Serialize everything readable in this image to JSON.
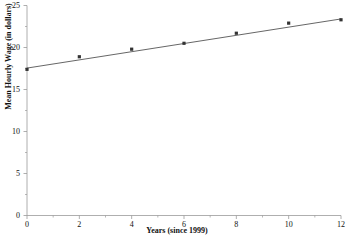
{
  "chart_data": {
    "type": "scatter",
    "title": "",
    "xlabel": "Years (since 1999)",
    "ylabel": "Mean Hourly Wage (in dollars)",
    "x": [
      0,
      2,
      4,
      6,
      8,
      10,
      12
    ],
    "values": [
      17.4,
      18.9,
      19.8,
      20.5,
      21.7,
      22.9,
      23.3
    ],
    "series": [
      {
        "name": "Mean Hourly Wage",
        "values": [
          17.4,
          18.9,
          19.8,
          20.5,
          21.7,
          22.9,
          23.3
        ],
        "marker": "square",
        "marker_color": "#333333"
      },
      {
        "name": "Linear trend line",
        "type": "line",
        "endpoints_x": [
          0,
          12
        ],
        "endpoints_y": [
          17.55,
          23.4
        ],
        "line_color": "#555555"
      }
    ],
    "xlim": [
      0,
      12
    ],
    "ylim": [
      0,
      25
    ],
    "xticks": [
      0,
      2,
      4,
      6,
      8,
      10,
      12
    ],
    "xtick_labels": [
      "0",
      "2",
      "4",
      "6",
      "8",
      "10",
      "12"
    ],
    "x_minor_ticks": [
      1,
      3,
      5,
      7,
      9,
      11
    ],
    "yticks": [
      0,
      5,
      10,
      15,
      20,
      25
    ],
    "ytick_labels": [
      "0",
      "5",
      "10",
      "15",
      "20",
      "25"
    ],
    "y_minor_ticks": [
      2.5,
      7.5,
      12.5,
      17.5,
      22.5
    ],
    "grid": false,
    "legend": false,
    "axis_color": "#9a9a9a",
    "background": "#ffffff"
  },
  "figure": {
    "title_fragment": "",
    "y_axis_title": "Mean Hourly Wage (in dollars)",
    "x_axis_title": "Years (since 1999)"
  }
}
